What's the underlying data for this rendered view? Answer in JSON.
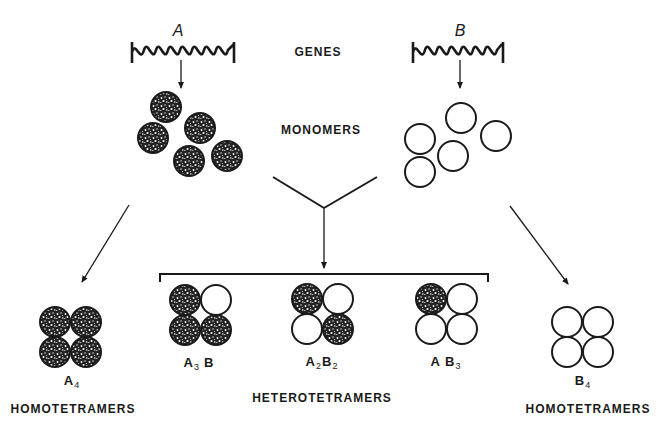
{
  "labels": {
    "genes": "GENES",
    "monomers": "MONOMERS",
    "heterotetramers": "HETEROTETRAMERS",
    "homotetramers_left": "HOMOTETRAMERS",
    "homotetramers_right": "HOMOTETRAMERS"
  },
  "genes": [
    {
      "letter": "A",
      "type": "filled"
    },
    {
      "letter": "B",
      "type": "open"
    }
  ],
  "tetramers": [
    {
      "name": "A4",
      "main": "A",
      "sub": "4",
      "main2": "",
      "sub2": "",
      "pattern": [
        "A",
        "A",
        "A",
        "A"
      ]
    },
    {
      "name": "A3B",
      "main": "A",
      "sub": "3",
      "main2": "B",
      "sub2": "",
      "pattern": [
        "A",
        "B",
        "A",
        "A"
      ]
    },
    {
      "name": "A2B2",
      "main": "A",
      "sub": "2",
      "main2": "B",
      "sub2": "2",
      "pattern": [
        "A",
        "B",
        "B",
        "A"
      ]
    },
    {
      "name": "AB3",
      "main": "A",
      "sub": "",
      "main2": "B",
      "sub2": "3",
      "pattern": [
        "A",
        "B",
        "B",
        "B"
      ]
    },
    {
      "name": "B4",
      "main": "B",
      "sub": "4",
      "main2": "",
      "sub2": "",
      "pattern": [
        "B",
        "B",
        "B",
        "B"
      ]
    }
  ],
  "colors": {
    "ink": "#1a1a1a",
    "background": "#ffffff"
  }
}
